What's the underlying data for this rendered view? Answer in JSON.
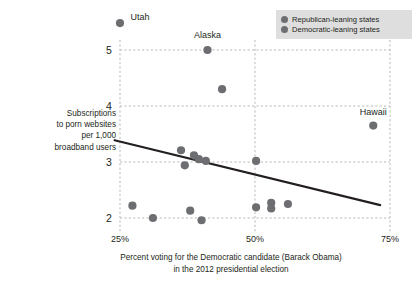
{
  "chart_data": {
    "type": "scatter",
    "title": "",
    "xlabel": "Percent voting for the Democratic candidate (Barack Obama) in the 2012 presidential election",
    "xlabel_lines": [
      "Percent voting for the Democratic candidate (Barack Obama)",
      "in the 2012 presidential election"
    ],
    "ylabel": "Subscriptions to porn websites per 1,000 broadband users",
    "ylabel_lines": [
      "Subscriptions",
      "to porn websites",
      "per 1,000",
      "broadband users"
    ],
    "xlim": [
      25,
      75
    ],
    "ylim": [
      1.78,
      5.6
    ],
    "xticks": [
      25,
      50,
      75
    ],
    "xtick_labels": [
      "25%",
      "50%",
      "75%"
    ],
    "yticks": [
      2,
      3,
      4,
      5
    ],
    "ytick_labels": [
      "2",
      "3",
      "4",
      "5"
    ],
    "grid": true,
    "grid_style": "dashed",
    "legend_position": "top-right",
    "legend": [
      {
        "label": "Republican-leaning states",
        "color": "#6d6e71"
      },
      {
        "label": "Democratic-leaning states",
        "color": "#6d6e71"
      }
    ],
    "marker_color": "#6d6e71",
    "trendline": {
      "label": "linear fit",
      "color": "#231f20",
      "x_start": 24.0,
      "y_start": 3.39,
      "x_end": 73.2,
      "y_end": 2.23
    },
    "points": [
      {
        "x": 25.0,
        "y": 5.48,
        "label": "Utah"
      },
      {
        "x": 41.2,
        "y": 5.0,
        "label": "Alaska"
      },
      {
        "x": 43.9,
        "y": 4.3,
        "label": ""
      },
      {
        "x": 71.9,
        "y": 3.65,
        "label": "Hawaii"
      },
      {
        "x": 36.3,
        "y": 3.21,
        "label": ""
      },
      {
        "x": 38.7,
        "y": 3.12,
        "label": ""
      },
      {
        "x": 39.6,
        "y": 3.05,
        "label": ""
      },
      {
        "x": 40.9,
        "y": 3.02,
        "label": ""
      },
      {
        "x": 37.0,
        "y": 2.94,
        "label": ""
      },
      {
        "x": 50.2,
        "y": 3.02,
        "label": ""
      },
      {
        "x": 27.3,
        "y": 2.22,
        "label": ""
      },
      {
        "x": 31.1,
        "y": 2.0,
        "label": ""
      },
      {
        "x": 38.0,
        "y": 2.13,
        "label": ""
      },
      {
        "x": 40.1,
        "y": 1.96,
        "label": ""
      },
      {
        "x": 50.2,
        "y": 2.19,
        "label": ""
      },
      {
        "x": 53.0,
        "y": 2.27,
        "label": ""
      },
      {
        "x": 53.0,
        "y": 2.17,
        "label": ""
      },
      {
        "x": 56.1,
        "y": 2.25,
        "label": ""
      }
    ],
    "point_labels": [
      {
        "text": "Utah",
        "x": 25.0,
        "y": 5.48
      },
      {
        "text": "Alaska",
        "x": 41.2,
        "y": 5.0
      },
      {
        "text": "Hawaii",
        "x": 71.9,
        "y": 3.65
      }
    ]
  }
}
